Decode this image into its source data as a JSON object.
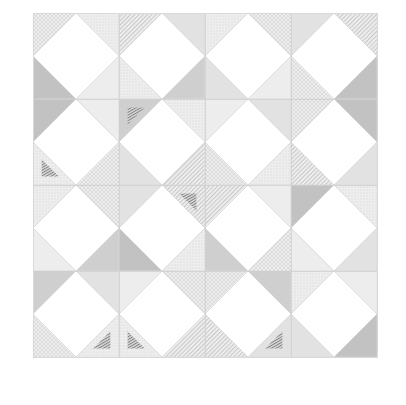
{
  "document": {
    "title": "Quilt Block Layout",
    "background_color": "#ffffff"
  },
  "canvas": {
    "width": 406,
    "height": 405
  },
  "quilt": {
    "name": "Square in a Square / Snowball quilt layout",
    "origin_x": 33,
    "origin_y": 13,
    "block_size": 86,
    "rows": 4,
    "columns": 4,
    "total_blocks": 16,
    "border_color": "#d9d9d9",
    "grid_line_color": "#cfcfcf",
    "grid_line_width": 0.7,
    "center_diamond_color": "#ffffff",
    "center_diamond_edge_color": "#d2d2d2",
    "seam_line_color": "#d8d8d8"
  },
  "fabrics": [
    {
      "id": "f-white",
      "label": "Solid White",
      "color": "#ffffff",
      "texture": "solid"
    },
    {
      "id": "f-pale-gray",
      "label": "Pale Gray Solid",
      "color": "#ededed",
      "texture": "solid"
    },
    {
      "id": "f-light-gray",
      "label": "Light Gray Solid",
      "color": "#e2e2e2",
      "texture": "solid"
    },
    {
      "id": "f-mid-gray",
      "label": "Mid Gray Solid",
      "color": "#cfcfcf",
      "texture": "solid"
    },
    {
      "id": "f-shadow-gray",
      "label": "Shadow Gray Solid",
      "color": "#c2c2c2",
      "texture": "solid"
    },
    {
      "id": "f-dots",
      "label": "Gray Dot Print",
      "color": "#e8e8e8",
      "texture": "dots"
    },
    {
      "id": "f-stripe",
      "label": "Fine Stripe Print",
      "color": "#e6e6e6",
      "texture": "stripes"
    },
    {
      "id": "f-hatch",
      "label": "Cross Hatch Print",
      "color": "#e4e4e4",
      "texture": "hatch"
    },
    {
      "id": "f-dark-stripe",
      "label": "Dark Stripe Accent",
      "color": "#9a9a9a",
      "texture": "dark-stripes"
    }
  ],
  "chart_data": {
    "type": "heatmap",
    "title": "Quilt Block Layout",
    "xlabel": "",
    "ylabel": "",
    "grid": true,
    "legend_position": "none",
    "categories": [
      "Col 1",
      "Col 2",
      "Col 3",
      "Col 4"
    ],
    "rows": [
      "Row 1",
      "Row 2",
      "Row 3",
      "Row 4"
    ],
    "blocks": [
      {
        "row": 0,
        "col": 0,
        "corners": [
          "f-hatch",
          "f-dots",
          "f-pale-gray",
          "f-shadow-gray"
        ],
        "accent": "none"
      },
      {
        "row": 0,
        "col": 1,
        "corners": [
          "f-stripe",
          "f-light-gray",
          "f-mid-gray",
          "f-dots"
        ],
        "accent": "none"
      },
      {
        "row": 0,
        "col": 2,
        "corners": [
          "f-dots",
          "f-hatch",
          "f-pale-gray",
          "f-light-gray"
        ],
        "accent": "none"
      },
      {
        "row": 0,
        "col": 3,
        "corners": [
          "f-light-gray",
          "f-stripe",
          "f-shadow-gray",
          "f-hatch"
        ],
        "accent": "none"
      },
      {
        "row": 1,
        "col": 0,
        "corners": [
          "f-shadow-gray",
          "f-pale-gray",
          "f-hatch",
          "f-dots"
        ],
        "accent": "bottom-left"
      },
      {
        "row": 1,
        "col": 1,
        "corners": [
          "f-mid-gray",
          "f-dots",
          "f-stripe",
          "f-light-gray"
        ],
        "accent": "top-left"
      },
      {
        "row": 1,
        "col": 2,
        "corners": [
          "f-pale-gray",
          "f-light-gray",
          "f-dots",
          "f-hatch"
        ],
        "accent": "none"
      },
      {
        "row": 1,
        "col": 3,
        "corners": [
          "f-hatch",
          "f-shadow-gray",
          "f-light-gray",
          "f-stripe"
        ],
        "accent": "none"
      },
      {
        "row": 2,
        "col": 0,
        "corners": [
          "f-dots",
          "f-hatch",
          "f-mid-gray",
          "f-pale-gray"
        ],
        "accent": "none"
      },
      {
        "row": 2,
        "col": 1,
        "corners": [
          "f-light-gray",
          "f-stripe",
          "f-dots",
          "f-shadow-gray"
        ],
        "accent": "top-right"
      },
      {
        "row": 2,
        "col": 2,
        "corners": [
          "f-stripe",
          "f-pale-gray",
          "f-hatch",
          "f-mid-gray"
        ],
        "accent": "none"
      },
      {
        "row": 2,
        "col": 3,
        "corners": [
          "f-shadow-gray",
          "f-dots",
          "f-light-gray",
          "f-pale-gray"
        ],
        "accent": "none"
      },
      {
        "row": 3,
        "col": 0,
        "corners": [
          "f-mid-gray",
          "f-light-gray",
          "f-dots",
          "f-hatch"
        ],
        "accent": "bottom-right"
      },
      {
        "row": 3,
        "col": 1,
        "corners": [
          "f-pale-gray",
          "f-hatch",
          "f-stripe",
          "f-dots"
        ],
        "accent": "bottom-left"
      },
      {
        "row": 3,
        "col": 2,
        "corners": [
          "f-hatch",
          "f-mid-gray",
          "f-light-gray",
          "f-stripe"
        ],
        "accent": "bottom-right"
      },
      {
        "row": 3,
        "col": 3,
        "corners": [
          "f-dots",
          "f-pale-gray",
          "f-shadow-gray",
          "f-light-gray"
        ],
        "accent": "none"
      }
    ]
  }
}
